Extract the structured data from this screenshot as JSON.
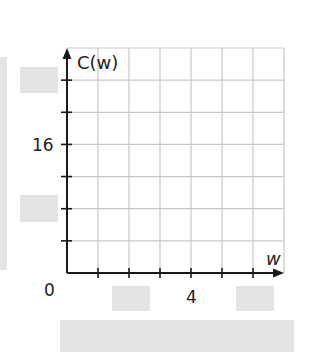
{
  "chart_data": {
    "type": "line",
    "title": "",
    "xlabel": "w",
    "ylabel": "C(w)",
    "x_ticks_labeled": [
      {
        "value": 0,
        "label": "0"
      },
      {
        "value": 4,
        "label": "4"
      }
    ],
    "y_ticks_labeled": [
      {
        "value": 0,
        "label": "0"
      },
      {
        "value": 16,
        "label": "16"
      }
    ],
    "xlim": [
      0,
      7
    ],
    "ylim": [
      0,
      28
    ],
    "x_step": 1,
    "y_step": 4,
    "grid": true,
    "series": []
  },
  "labels": {
    "y_axis": "C(w)",
    "x_axis": "w",
    "origin": "0",
    "y16": "16",
    "x4": "4"
  },
  "colors": {
    "axis": "#1a1a1a",
    "grid": "#c8c8c8",
    "mask": "#e4e4e4"
  }
}
